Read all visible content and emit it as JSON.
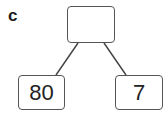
{
  "diagram": {
    "label": "c",
    "type": "part-whole number bond",
    "whole": {
      "value": ""
    },
    "parts": [
      {
        "value": "80"
      },
      {
        "value": "7"
      }
    ],
    "colors": {
      "stroke": "#555555",
      "text": "#222222",
      "background": "#ffffff"
    }
  }
}
